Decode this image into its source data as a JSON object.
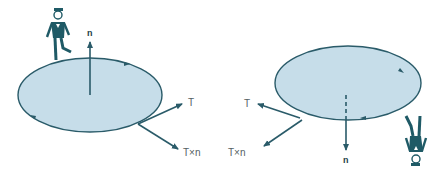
{
  "diagram": {
    "colors": {
      "surface_fill": "#c6dde9",
      "outline": "#2a5b69",
      "vector": "#2a5b69",
      "figure": "#1f5a66",
      "label": "#555f63",
      "background": "#ffffff"
    },
    "left_panel": {
      "normal_label": "n",
      "tangent_label": "T",
      "cross_label": "T×n",
      "figure": "person-walking-upright",
      "normal_direction": "up"
    },
    "right_panel": {
      "normal_label": "n",
      "tangent_label": "T",
      "cross_label": "T×n",
      "figure": "person-walking-upside-down",
      "normal_direction": "down"
    }
  }
}
